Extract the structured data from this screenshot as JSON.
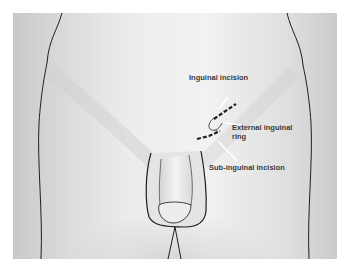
{
  "figure": {
    "type": "anatomical-illustration",
    "background_color": "#d8d8d8",
    "outline_color": "#1e1e1e",
    "incision_color": "#222222"
  },
  "labels": {
    "inguinal_incision": "Inguinal incision",
    "external_ring_line1": "External inguinal",
    "external_ring_line2": "ring",
    "sub_inguinal_incision": "Sub-inguinal incision",
    "ring_marker": "x"
  }
}
